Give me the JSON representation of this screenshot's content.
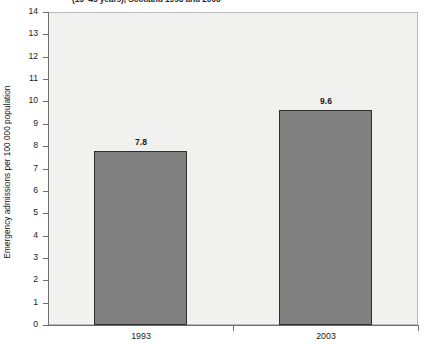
{
  "chart_data": {
    "type": "bar",
    "title": "(15–45 years), Scotland 1993 and 2003",
    "xlabel": "",
    "ylabel": "Emergency admissions per 100 000 population",
    "categories": [
      "1993",
      "2003"
    ],
    "values": [
      7.8,
      9.6
    ],
    "value_labels": [
      "7.8",
      "9.6"
    ],
    "ylim": [
      0,
      14
    ],
    "ytick_labels": [
      "14",
      "13",
      "12",
      "11",
      "10",
      "9",
      "8",
      "7",
      "6",
      "5",
      "4",
      "3",
      "2",
      "1",
      "0"
    ],
    "ytick_values": [
      14,
      13,
      12,
      11,
      10,
      9,
      8,
      7,
      6,
      5,
      4,
      3,
      2,
      1,
      0
    ],
    "grid": false,
    "legend": null,
    "colors": {
      "bar_fill": "#808080",
      "bar_edge": "#2e2e2e",
      "plot_background": "#f1f1f0",
      "axis": "#6f6f6f",
      "text": "#1a1a1a"
    }
  }
}
